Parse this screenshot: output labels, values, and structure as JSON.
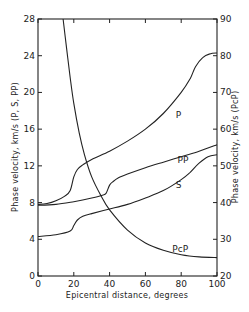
{
  "chart_data": {
    "type": "line",
    "title": "",
    "xlabel": "Epicentral distance, degrees",
    "ylabel": "Phase velocity, km/s (P, S, PP)",
    "y2label": "Phase velocity, km/s (PcP)",
    "xlim": [
      0,
      100
    ],
    "ylim": [
      0,
      28
    ],
    "y2lim": [
      20,
      90
    ],
    "xticks": [
      0,
      20,
      40,
      60,
      80,
      100
    ],
    "yticks": [
      0,
      4,
      8,
      12,
      16,
      20,
      24,
      28
    ],
    "y2ticks": [
      20,
      30,
      40,
      50,
      60,
      70,
      80,
      90
    ],
    "grid": false,
    "legend": "inline curve labels",
    "series": [
      {
        "name": "P",
        "axis": "left",
        "x": [
          0,
          5,
          10,
          15,
          18,
          20,
          22,
          25,
          30,
          40,
          50,
          60,
          70,
          80,
          85,
          88,
          92,
          96,
          100
        ],
        "y": [
          7.8,
          7.9,
          8.2,
          8.7,
          9.3,
          10.8,
          11.6,
          12.1,
          12.7,
          13.6,
          14.7,
          16.0,
          17.7,
          20.0,
          21.5,
          22.8,
          23.8,
          24.2,
          24.3
        ],
        "label_pos": [
          77,
          17.2
        ]
      },
      {
        "name": "PP",
        "axis": "left",
        "x": [
          0,
          10,
          20,
          30,
          36,
          38,
          40,
          42,
          45,
          50,
          60,
          70,
          80,
          90,
          100
        ],
        "y": [
          7.7,
          7.8,
          8.1,
          8.5,
          8.8,
          9.0,
          9.9,
          10.3,
          10.7,
          11.1,
          11.8,
          12.4,
          13.0,
          13.6,
          14.3
        ],
        "label_pos": [
          78,
          12.3
        ]
      },
      {
        "name": "S",
        "axis": "left",
        "x": [
          0,
          10,
          18,
          20,
          22,
          25,
          30,
          40,
          50,
          60,
          70,
          80,
          85,
          90,
          95,
          100
        ],
        "y": [
          4.3,
          4.5,
          4.9,
          5.5,
          6.1,
          6.5,
          6.8,
          7.3,
          7.8,
          8.5,
          9.3,
          10.5,
          11.3,
          12.3,
          13.0,
          13.2
        ],
        "label_pos": [
          77,
          9.6
        ]
      },
      {
        "name": "PcP",
        "axis": "right",
        "x": [
          14,
          16,
          18,
          20,
          23,
          26,
          30,
          35,
          40,
          50,
          60,
          70,
          80,
          90,
          100
        ],
        "y": [
          90,
          82,
          74,
          67,
          59,
          53,
          47,
          42,
          38,
          32.5,
          29,
          27,
          25.8,
          25.2,
          25
        ],
        "label_pos": [
          75,
          26.6
        ]
      }
    ]
  },
  "labels": {
    "xlabel": "Epicentral distance, degrees",
    "ylabel": "Phase velocity, km/s (P, S, PP)",
    "y2label": "Phase velocity, km/s (PcP)"
  }
}
